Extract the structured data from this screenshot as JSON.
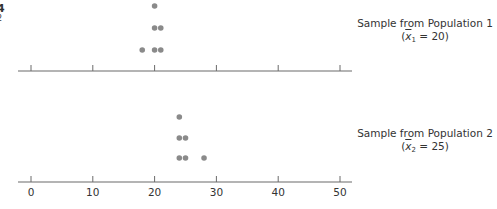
{
  "corner_fragments": [
    "4",
    "2"
  ],
  "chart_data": [
    {
      "type": "scatter",
      "subtype": "dot_plot",
      "title": "Sample from Population 1",
      "mean_label": "x̄1 = 20",
      "mean_symbol": "x",
      "mean_subscript": "1",
      "mean_value": "20",
      "values": [
        18,
        20,
        20,
        20,
        21,
        21
      ],
      "points": [
        {
          "x": 20,
          "level": 3
        },
        {
          "x": 20,
          "level": 2
        },
        {
          "x": 21,
          "level": 2
        },
        {
          "x": 18,
          "level": 1
        },
        {
          "x": 20,
          "level": 1
        },
        {
          "x": 21,
          "level": 1
        }
      ],
      "xlim": [
        0,
        50
      ],
      "xticks": [
        0,
        10,
        20,
        30,
        40,
        50
      ],
      "tick_labels_shown": false,
      "dot_color": "#8a8a8a"
    },
    {
      "type": "scatter",
      "subtype": "dot_plot",
      "title": "Sample from Population 2",
      "mean_label": "x̄2 = 25",
      "mean_symbol": "x",
      "mean_subscript": "2",
      "mean_value": "25",
      "values": [
        24,
        24,
        24,
        25,
        25,
        28
      ],
      "points": [
        {
          "x": 24,
          "level": 3
        },
        {
          "x": 24,
          "level": 2
        },
        {
          "x": 25,
          "level": 2
        },
        {
          "x": 24,
          "level": 1
        },
        {
          "x": 25,
          "level": 1
        },
        {
          "x": 28,
          "level": 1
        }
      ],
      "xlim": [
        0,
        50
      ],
      "xticks": [
        0,
        10,
        20,
        30,
        40,
        50
      ],
      "tick_labels": [
        "0",
        "10",
        "20",
        "30",
        "40",
        "50"
      ],
      "tick_labels_shown": true,
      "dot_color": "#8a8a8a"
    }
  ],
  "captions": {
    "pop1": {
      "title": "Sample from Population 1",
      "open": "(",
      "sym": "x",
      "sub": "1",
      "eq": " = 20)"
    },
    "pop2": {
      "title": "Sample from Population 2",
      "open": "(",
      "sym": "x",
      "sub": "2",
      "eq": " = 25)"
    }
  },
  "axis_tick_labels": [
    "0",
    "10",
    "20",
    "30",
    "40",
    "50"
  ]
}
